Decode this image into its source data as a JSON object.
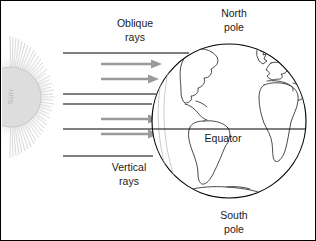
{
  "figure": {
    "border_color": "#000000",
    "background_color": "#ffffff"
  },
  "sun": {
    "label": "Sun",
    "label_orientation": "vertical-bottom-to-top",
    "body_color": "#d8d8d8",
    "ray_burst_color": "#c4c4c4",
    "outline_color": "#c9c9c9",
    "center_x": 10,
    "center_y": 96,
    "radius": 30
  },
  "labels": {
    "oblique_rays": {
      "line1": "Oblique",
      "line2": "rays",
      "x": 134,
      "y": 30
    },
    "vertical_rays": {
      "line1": "Vertical",
      "line2": "rays",
      "x": 128,
      "y": 160
    },
    "north_pole": {
      "line1": "North",
      "line2": "pole",
      "x": 232,
      "y": 17
    },
    "south_pole": {
      "line1": "South",
      "line2": "pole",
      "x": 232,
      "y": 219
    },
    "equator": {
      "text": "Equator",
      "x": 222,
      "y": 140
    }
  },
  "globe": {
    "center_x": 228,
    "center_y": 120,
    "radius": 77,
    "outline_color": "#000000",
    "fill_color": "#ffffff",
    "coastline_color": "#2b2b2b",
    "terminator_color": "#cccccc",
    "continents": [
      "North America",
      "South America",
      "Europe",
      "Africa",
      "Antarctica",
      "Greenland"
    ]
  },
  "equator_line": {
    "y": 128,
    "x_start": 62,
    "x_end": 305,
    "color": "#000000"
  },
  "rays": {
    "solid_color": "#000000",
    "arrow_color": "#9a9a9a",
    "solid": [
      {
        "name": "oblique-boundary-top",
        "y": 52,
        "x_start": 62,
        "x_end": 188
      },
      {
        "name": "oblique-boundary-bottom",
        "y": 93,
        "x_start": 62,
        "x_end": 155
      },
      {
        "name": "vertical-boundary-top",
        "y": 103,
        "x_start": 62,
        "x_end": 151
      },
      {
        "name": "vertical-boundary-bottom",
        "y": 155,
        "x_start": 62,
        "x_end": 152
      }
    ],
    "arrows": [
      {
        "name": "oblique-arrow-1",
        "y": 63,
        "x_start": 100,
        "x_end": 160
      },
      {
        "name": "oblique-arrow-2",
        "y": 78,
        "x_start": 100,
        "x_end": 157
      },
      {
        "name": "vertical-arrow-1",
        "y": 118,
        "x_start": 100,
        "x_end": 157
      },
      {
        "name": "vertical-arrow-2",
        "y": 133,
        "x_start": 100,
        "x_end": 157
      }
    ]
  }
}
